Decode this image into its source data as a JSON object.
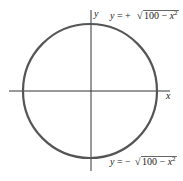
{
  "diagram": {
    "type": "circle-graph",
    "axes": {
      "x_label": "x",
      "y_label": "y"
    },
    "circle": {
      "equation": "x^2 + y^2 = 100",
      "radius": 10,
      "stroke_color": "#555555"
    },
    "annotations": {
      "upper": {
        "prefix": "y = +",
        "radicand": "100 − x",
        "exponent": "2"
      },
      "lower": {
        "prefix": "y = −",
        "radicand": "100 − x",
        "exponent": "2"
      }
    },
    "axis_color": "#333333"
  }
}
